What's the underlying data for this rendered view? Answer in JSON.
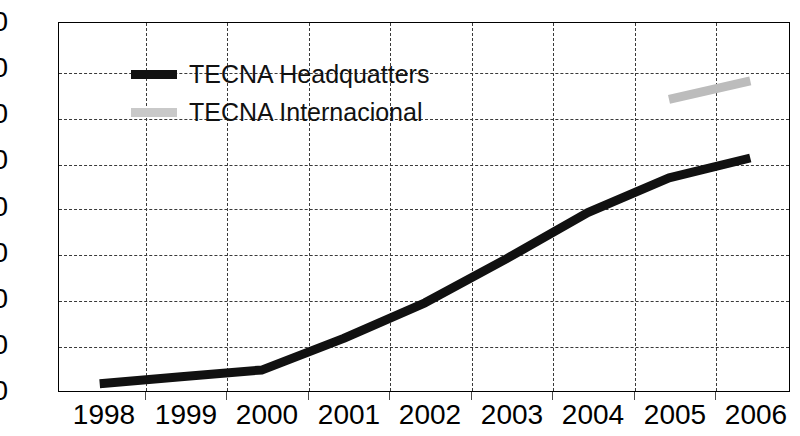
{
  "chart_data": {
    "type": "line",
    "title": "",
    "xlabel": "",
    "ylabel": "",
    "categories": [
      "1998",
      "1999",
      "2000",
      "2001",
      "2002",
      "2003",
      "2004",
      "2005",
      "2006"
    ],
    "ylim": [
      0,
      800
    ],
    "ytick_values": [
      0,
      100,
      200,
      300,
      400,
      500,
      600,
      700,
      800
    ],
    "ytick_labels": [
      "0",
      "100",
      "200",
      "300",
      "400",
      "500",
      "600",
      "700",
      "800"
    ],
    "grid": "dashed horizontal and vertical gridlines",
    "legend_position": "top-left inside plot area",
    "series": [
      {
        "name": "TECNA Headquatters",
        "color": "#111111",
        "values": [
          20,
          35,
          50,
          118,
          195,
          290,
          390,
          465,
          508
        ],
        "categories": [
          "1998",
          "1999",
          "2000",
          "2001",
          "2002",
          "2003",
          "2004",
          "2005",
          "2006"
        ]
      },
      {
        "name": "TECNA Internacional",
        "color": "#bcbcbc",
        "values": [
          null,
          null,
          null,
          null,
          null,
          null,
          null,
          635,
          675
        ],
        "categories": [
          "1998",
          "1999",
          "2000",
          "2001",
          "2002",
          "2003",
          "2004",
          "2005",
          "2006"
        ]
      }
    ]
  },
  "legend": {
    "items": [
      {
        "label": "TECNA Headquatters",
        "color": "#111111",
        "swatch": "legend-swatch-black"
      },
      {
        "label": "TECNA Internacional",
        "color": "#bcbcbc",
        "swatch": "legend-swatch-gray"
      }
    ]
  },
  "axes": {
    "y_labels": [
      "800",
      "700",
      "600",
      "500",
      "400",
      "300",
      "200",
      "100",
      "0"
    ],
    "x_labels": [
      "1998",
      "1999",
      "2000",
      "2001",
      "2002",
      "2003",
      "2004",
      "2005",
      "2006"
    ]
  }
}
